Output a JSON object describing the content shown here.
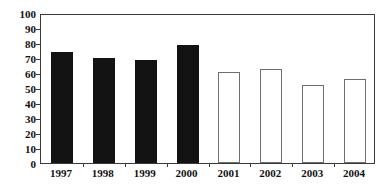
{
  "chart_data": {
    "type": "bar",
    "title": "",
    "subtitle": "",
    "xlabel": "",
    "ylabel": "",
    "categories": [
      "1997",
      "1998",
      "1999",
      "2000",
      "2001",
      "2002",
      "2003",
      "2004"
    ],
    "values": [
      74,
      70,
      69,
      79,
      61,
      63,
      52,
      56
    ],
    "bar_styles": [
      "filled",
      "filled",
      "filled",
      "filled",
      "hollow",
      "hollow",
      "hollow",
      "hollow"
    ],
    "ylim": [
      0,
      100
    ],
    "yticks": [
      0,
      10,
      20,
      30,
      40,
      50,
      60,
      70,
      80,
      90,
      100
    ],
    "ytick_labels": [
      "0",
      "10",
      "20",
      "30",
      "40",
      "50",
      "60",
      "70",
      "80",
      "90",
      "100"
    ],
    "grid": false,
    "legend": null,
    "legend_position": "none",
    "colors": {
      "filled_bar": "#131313",
      "hollow_bar_fill": "#ffffff",
      "hollow_bar_edge": "#6e6e6e",
      "axis": "#3a3a3a",
      "text": "#111111",
      "background": "#ffffff"
    }
  }
}
